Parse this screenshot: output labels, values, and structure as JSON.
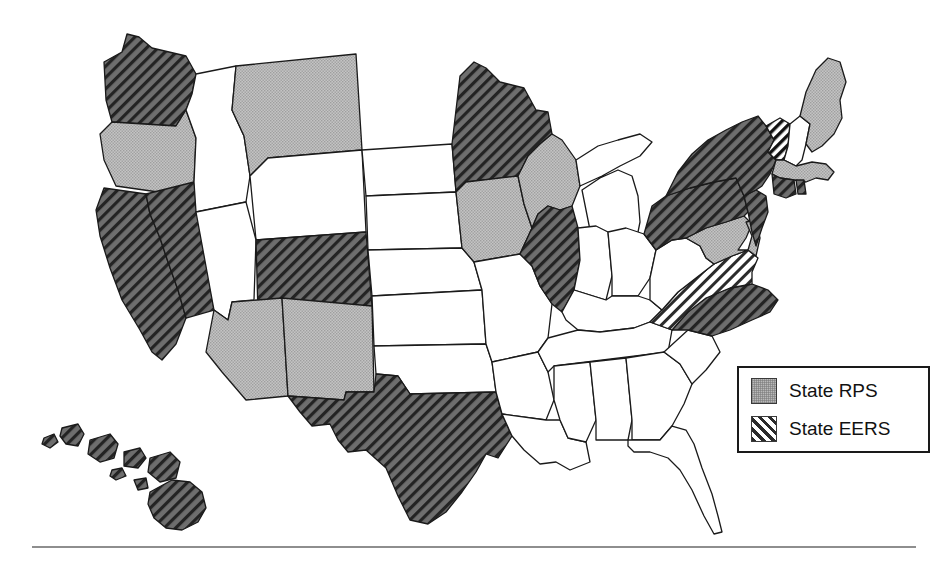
{
  "figure": {
    "type": "choropleth-map",
    "region": "United States",
    "background_color": "#ffffff",
    "outline_color": "#1a1a1a"
  },
  "legend": {
    "name": "map-legend",
    "border_color": "#1a1a1a",
    "items": [
      {
        "key": "rps",
        "label": "State RPS",
        "pattern": "solid-gray",
        "color": "#b9b9b9"
      },
      {
        "key": "eers",
        "label": "State EERS",
        "pattern": "diagonal-hatch",
        "color": "#2b2b2b"
      }
    ]
  },
  "map_data": {
    "type": "categorical-map",
    "categories": [
      {
        "key": "none",
        "label": "No policy",
        "fill": "#ffffff",
        "hatch": false
      },
      {
        "key": "rps",
        "label": "State RPS",
        "fill": "#b9b9b9",
        "hatch": false
      },
      {
        "key": "eers",
        "label": "State EERS",
        "fill": "#ffffff",
        "hatch": true
      },
      {
        "key": "both",
        "label": "State RPS and EERS",
        "fill": "#6e6e6e",
        "hatch": true
      }
    ],
    "states": [
      {
        "code": "WA",
        "name": "Washington",
        "category": "both"
      },
      {
        "code": "OR",
        "name": "Oregon",
        "category": "rps"
      },
      {
        "code": "CA",
        "name": "California",
        "category": "both"
      },
      {
        "code": "NV",
        "name": "Nevada",
        "category": "both"
      },
      {
        "code": "ID",
        "name": "Idaho",
        "category": "none"
      },
      {
        "code": "MT",
        "name": "Montana",
        "category": "rps"
      },
      {
        "code": "WY",
        "name": "Wyoming",
        "category": "none"
      },
      {
        "code": "UT",
        "name": "Utah",
        "category": "none"
      },
      {
        "code": "AZ",
        "name": "Arizona",
        "category": "rps"
      },
      {
        "code": "NM",
        "name": "New Mexico",
        "category": "rps"
      },
      {
        "code": "CO",
        "name": "Colorado",
        "category": "both"
      },
      {
        "code": "ND",
        "name": "North Dakota",
        "category": "none"
      },
      {
        "code": "SD",
        "name": "South Dakota",
        "category": "none"
      },
      {
        "code": "NE",
        "name": "Nebraska",
        "category": "none"
      },
      {
        "code": "KS",
        "name": "Kansas",
        "category": "none"
      },
      {
        "code": "OK",
        "name": "Oklahoma",
        "category": "none"
      },
      {
        "code": "TX",
        "name": "Texas",
        "category": "both"
      },
      {
        "code": "MN",
        "name": "Minnesota",
        "category": "both"
      },
      {
        "code": "IA",
        "name": "Iowa",
        "category": "rps"
      },
      {
        "code": "MO",
        "name": "Missouri",
        "category": "none"
      },
      {
        "code": "AR",
        "name": "Arkansas",
        "category": "none"
      },
      {
        "code": "LA",
        "name": "Louisiana",
        "category": "none"
      },
      {
        "code": "WI",
        "name": "Wisconsin",
        "category": "rps"
      },
      {
        "code": "IL",
        "name": "Illinois",
        "category": "both"
      },
      {
        "code": "MI",
        "name": "Michigan",
        "category": "none"
      },
      {
        "code": "IN",
        "name": "Indiana",
        "category": "none"
      },
      {
        "code": "OH",
        "name": "Ohio",
        "category": "none"
      },
      {
        "code": "KY",
        "name": "Kentucky",
        "category": "none"
      },
      {
        "code": "TN",
        "name": "Tennessee",
        "category": "none"
      },
      {
        "code": "MS",
        "name": "Mississippi",
        "category": "none"
      },
      {
        "code": "AL",
        "name": "Alabama",
        "category": "none"
      },
      {
        "code": "GA",
        "name": "Georgia",
        "category": "none"
      },
      {
        "code": "FL",
        "name": "Florida",
        "category": "none"
      },
      {
        "code": "SC",
        "name": "South Carolina",
        "category": "none"
      },
      {
        "code": "NC",
        "name": "North Carolina",
        "category": "both"
      },
      {
        "code": "VA",
        "name": "Virginia",
        "category": "eers"
      },
      {
        "code": "WV",
        "name": "West Virginia",
        "category": "none"
      },
      {
        "code": "MD",
        "name": "Maryland",
        "category": "rps"
      },
      {
        "code": "DE",
        "name": "Delaware",
        "category": "rps"
      },
      {
        "code": "PA",
        "name": "Pennsylvania",
        "category": "both"
      },
      {
        "code": "NJ",
        "name": "New Jersey",
        "category": "both"
      },
      {
        "code": "NY",
        "name": "New York",
        "category": "both"
      },
      {
        "code": "CT",
        "name": "Connecticut",
        "category": "both"
      },
      {
        "code": "RI",
        "name": "Rhode Island",
        "category": "both"
      },
      {
        "code": "MA",
        "name": "Massachusetts",
        "category": "rps"
      },
      {
        "code": "VT",
        "name": "Vermont",
        "category": "eers"
      },
      {
        "code": "NH",
        "name": "New Hampshire",
        "category": "none"
      },
      {
        "code": "ME",
        "name": "Maine",
        "category": "rps"
      },
      {
        "code": "HI",
        "name": "Hawaii",
        "category": "both"
      }
    ],
    "counts": {
      "rps_only": 11,
      "eers_only": 2,
      "both": 15,
      "none": 21
    }
  }
}
